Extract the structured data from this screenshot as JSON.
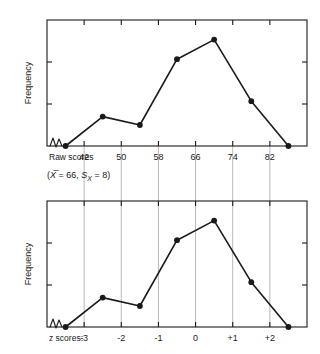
{
  "figure": {
    "background": "#ffffff",
    "ink": "#1a1a1a",
    "grid_color": "#b9b9b9",
    "note": {
      "open_paren": "(",
      "mean_symbol": "X",
      "mean_eq": " = 66, ",
      "sd_symbol": "S",
      "sd_subscript": "X",
      "sd_eq": " = 8)"
    }
  },
  "chart_data": [
    {
      "type": "line",
      "id": "raw-score-polygon",
      "title": "",
      "xlabel": "Raw scores",
      "ylabel": "Frequency",
      "grid": false,
      "legend": null,
      "x": [
        38,
        46,
        54,
        62,
        70,
        78,
        86
      ],
      "values": [
        0,
        2.1,
        1.5,
        6.2,
        7.6,
        3.2,
        0
      ],
      "tick_labels": [
        "42",
        "50",
        "58",
        "66",
        "74",
        "82"
      ],
      "tick_values": [
        42,
        50,
        58,
        66,
        74,
        82
      ],
      "xlim": [
        34,
        90
      ],
      "ylim": [
        0,
        9
      ],
      "axis_break": true,
      "y_ticks_unlabeled": 2
    },
    {
      "type": "line",
      "id": "z-score-polygon",
      "title": "",
      "xlabel": "z scores:",
      "ylabel": "Frequency",
      "grid": true,
      "legend": null,
      "x": [
        -3.5,
        -2.5,
        -1.5,
        -0.5,
        0.5,
        1.5,
        2.5
      ],
      "values": [
        0,
        2.1,
        1.5,
        6.2,
        7.6,
        3.2,
        0
      ],
      "tick_labels": [
        "-3",
        "-2",
        "-1",
        "0",
        "+1",
        "+2"
      ],
      "tick_values": [
        -3,
        -2,
        -1,
        0,
        1,
        2
      ],
      "xlim": [
        -4,
        3
      ],
      "ylim": [
        0,
        9
      ],
      "axis_break": true,
      "y_ticks_unlabeled": 2
    }
  ]
}
